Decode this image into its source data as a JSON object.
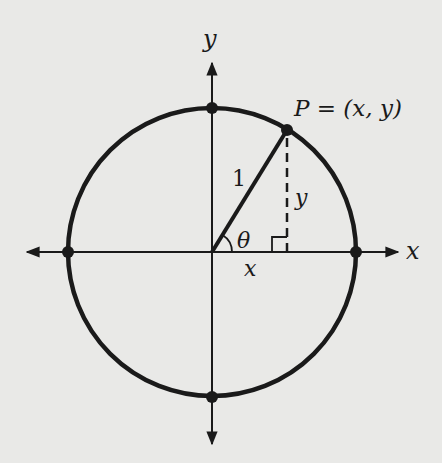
{
  "diagram": {
    "labels": {
      "y_axis": "y",
      "x_axis": "x",
      "point": "P = (x, y)",
      "radius": "1",
      "angle": "θ",
      "leg_x": "x",
      "leg_y": "y"
    },
    "colors": {
      "background": "#e9e9e7",
      "ink": "#1a1a1a"
    }
  }
}
